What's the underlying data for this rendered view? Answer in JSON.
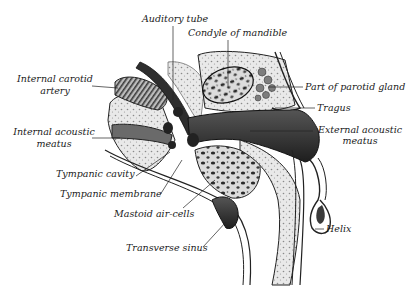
{
  "figure": {
    "background": "#ffffff",
    "ink": "#1a1a1a",
    "labels": {
      "auditory_tube": "Auditory tube",
      "condyle_of_mandible": "Condyle of mandible",
      "internal_carotid_artery_line1": "Internal carotid",
      "internal_carotid_artery_line2": "artery",
      "part_of_parotid_gland": "Part of parotid gland",
      "tragus": "Tragus",
      "internal_acoustic_meatus_line1": "Internal acoustic",
      "internal_acoustic_meatus_line2": "meatus",
      "external_acoustic_meatus_line1": "External acoustic",
      "external_acoustic_meatus_line2": "meatus",
      "tympanic_cavity": "Tympanic cavity",
      "tympanic_membrane": "Tympanic membrane",
      "mastoid_air_cells": "Mastoid air-cells",
      "transverse_sinus": "Transverse sinus",
      "helix": "Helix"
    }
  }
}
